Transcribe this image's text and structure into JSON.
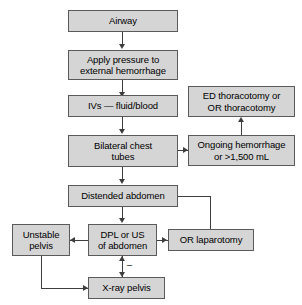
{
  "diagram": {
    "colors": {
      "node_fill": "#d5d5d5",
      "node_border": "#5a5a5a",
      "edge": "#3d3d3d",
      "text": "#000000",
      "background": "#ffffff"
    },
    "nodes": [
      {
        "id": "airway",
        "label": "Airway"
      },
      {
        "id": "apply-pressure",
        "label": "Apply pressure to\nexternal hemorrhage"
      },
      {
        "id": "ivs",
        "label": "IVs — fluid/blood"
      },
      {
        "id": "ed-thoracotomy",
        "label": "ED thoracotomy or\nOR thoracotomy"
      },
      {
        "id": "chest-tubes",
        "label": "Bilateral chest\ntubes"
      },
      {
        "id": "ongoing-hemorrhage",
        "label": "Ongoing hemorrhage\nor >1,500 mL"
      },
      {
        "id": "distended-abdomen",
        "label": "Distended abdomen"
      },
      {
        "id": "unstable-pelvis",
        "label": "Unstable\npelvis"
      },
      {
        "id": "dpl-us",
        "label": "DPL or US\nof abdomen"
      },
      {
        "id": "or-laparotomy",
        "label": "OR laparotomy"
      },
      {
        "id": "xray-pelvis",
        "label": "X-ray pelvis"
      }
    ],
    "annotations": [
      {
        "id": "negative-sign",
        "label": "–"
      }
    ]
  }
}
